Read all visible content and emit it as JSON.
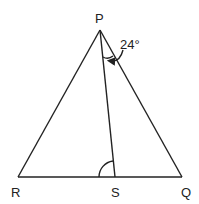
{
  "diagram": {
    "vertices": [
      {
        "name": "P",
        "label": "P",
        "x": 100,
        "y": 30
      },
      {
        "name": "R",
        "label": "R",
        "x": 18,
        "y": 177
      },
      {
        "name": "S",
        "label": "S",
        "x": 115,
        "y": 177
      },
      {
        "name": "Q",
        "label": "Q",
        "x": 182,
        "y": 177
      }
    ],
    "segments": [
      "PR",
      "PQ",
      "PS",
      "RQ"
    ],
    "angles": [
      {
        "at": "P",
        "between": "SPQ",
        "label": "24°"
      },
      {
        "at": "S",
        "between": "PSR",
        "label": ""
      }
    ]
  },
  "labels": {
    "P": "P",
    "R": "R",
    "S": "S",
    "Q": "Q",
    "angle_P": "24°"
  }
}
